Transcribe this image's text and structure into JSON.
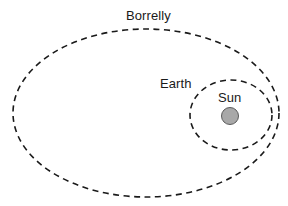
{
  "diagram": {
    "type": "orbit-diagram",
    "background_color": "#ffffff",
    "stroke_color": "#1a1a1a",
    "labels": {
      "borrelly": "Borrelly",
      "earth": "Earth",
      "sun": "Sun"
    },
    "bodies": {
      "sun": {
        "name": "Sun",
        "shape": "circle",
        "fill_color": "#a8a8a8",
        "stroke_color": "#5a5a5a",
        "cx": 230,
        "cy": 116,
        "r": 8.5
      }
    },
    "orbits": [
      {
        "name": "Borrelly",
        "style": "dashed",
        "shape": "ellipse",
        "cx": 146,
        "cy": 113,
        "rx": 133,
        "ry": 84,
        "stroke_color": "#1a1a1a",
        "stroke_width": 1.6,
        "dash": "6 4.5"
      },
      {
        "name": "Earth",
        "style": "dashed",
        "shape": "ellipse",
        "cx": 231,
        "cy": 115,
        "rx": 41,
        "ry": 35,
        "stroke_color": "#1a1a1a",
        "stroke_width": 1.6,
        "dash": "6 4.5"
      }
    ]
  }
}
